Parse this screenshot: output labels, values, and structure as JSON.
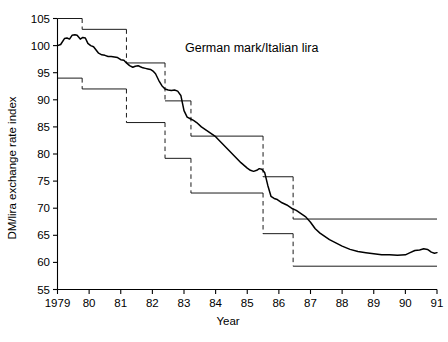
{
  "chart_data": {
    "type": "line",
    "title": "German mark/Italian lira",
    "xlabel": "Year",
    "ylabel": "DM/lira exchange rate index",
    "xlim": [
      1979,
      1991
    ],
    "ylim": [
      55,
      105
    ],
    "ytick_values": [
      55,
      60,
      65,
      70,
      75,
      80,
      85,
      90,
      95,
      100,
      105
    ],
    "ytick_labels": [
      "55",
      "60",
      "65",
      "70",
      "75",
      "80",
      "85",
      "90",
      "95",
      "100",
      "105"
    ],
    "xtick_values": [
      1979,
      1980,
      1981,
      1982,
      1983,
      1984,
      1985,
      1986,
      1987,
      1988,
      1989,
      1990,
      1991
    ],
    "xtick_labels": [
      "1979",
      "80",
      "81",
      "82",
      "83",
      "84",
      "85",
      "86",
      "87",
      "88",
      "89",
      "90",
      "91"
    ],
    "grid": false,
    "legend": false,
    "series": [
      {
        "name": "DM/lira exchange rate index",
        "style": "solid-thick",
        "x": [
          1979.0,
          1979.1,
          1979.22,
          1979.3,
          1979.38,
          1979.46,
          1979.55,
          1979.62,
          1979.72,
          1979.8,
          1979.88,
          1979.96,
          1980.05,
          1980.14,
          1980.22,
          1980.3,
          1980.4,
          1980.5,
          1980.6,
          1980.7,
          1980.8,
          1980.9,
          1981.0,
          1981.1,
          1981.18,
          1981.28,
          1981.38,
          1981.46,
          1981.55,
          1981.62,
          1981.7,
          1981.78,
          1981.86,
          1981.94,
          1982.02,
          1982.1,
          1982.2,
          1982.3,
          1982.4,
          1982.5,
          1982.6,
          1982.7,
          1982.8,
          1982.9,
          1983.0,
          1983.1,
          1983.2,
          1983.3,
          1983.4,
          1983.55,
          1983.7,
          1983.85,
          1984.0,
          1984.2,
          1984.4,
          1984.6,
          1984.8,
          1985.0,
          1985.1,
          1985.2,
          1985.3,
          1985.38,
          1985.46,
          1985.55,
          1985.65,
          1985.75,
          1985.85,
          1985.95,
          1986.1,
          1986.25,
          1986.4,
          1986.55,
          1986.7,
          1986.85,
          1987.0,
          1987.15,
          1987.3,
          1987.45,
          1987.6,
          1987.8,
          1988.0,
          1988.25,
          1988.5,
          1988.75,
          1989.0,
          1989.25,
          1989.5,
          1989.75,
          1990.0,
          1990.15,
          1990.3,
          1990.45,
          1990.58,
          1990.7,
          1990.82,
          1990.92,
          1991.0
        ],
        "y": [
          100.0,
          100.2,
          101.3,
          101.4,
          101.2,
          101.9,
          102.0,
          101.9,
          101.2,
          101.5,
          101.4,
          100.4,
          100.0,
          99.8,
          99.2,
          98.6,
          98.3,
          98.2,
          98.0,
          98.0,
          97.9,
          97.8,
          97.4,
          97.3,
          96.8,
          96.3,
          96.0,
          96.2,
          96.3,
          96.1,
          95.9,
          95.8,
          95.7,
          95.6,
          95.3,
          94.8,
          93.6,
          92.6,
          92.0,
          91.8,
          91.7,
          91.8,
          91.6,
          90.8,
          88.0,
          86.8,
          86.5,
          86.2,
          85.8,
          85.0,
          84.4,
          83.8,
          83.2,
          82.0,
          80.8,
          79.6,
          78.4,
          77.4,
          77.0,
          76.8,
          77.0,
          77.3,
          77.2,
          76.6,
          74.2,
          72.2,
          71.8,
          71.6,
          71.0,
          70.6,
          70.0,
          69.6,
          69.0,
          68.4,
          67.4,
          66.2,
          65.4,
          64.8,
          64.2,
          63.6,
          63.0,
          62.4,
          62.0,
          61.8,
          61.6,
          61.4,
          61.4,
          61.3,
          61.4,
          61.8,
          62.2,
          62.3,
          62.5,
          62.4,
          61.9,
          61.7,
          61.8
        ]
      }
    ],
    "bands": {
      "description": "Stepped intervention band limits with dashed vertical realignment connectors",
      "upper": {
        "name": "upper band limit",
        "steps": [
          {
            "x_start": 1979.0,
            "x_end": 1979.78,
            "y": 105.0
          },
          {
            "x_start": 1979.78,
            "x_end": 1981.18,
            "y": 103.0
          },
          {
            "x_start": 1981.18,
            "x_end": 1982.4,
            "y": 96.8
          },
          {
            "x_start": 1982.4,
            "x_end": 1983.22,
            "y": 89.8
          },
          {
            "x_start": 1983.22,
            "x_end": 1985.5,
            "y": 83.3
          },
          {
            "x_start": 1985.5,
            "x_end": 1986.45,
            "y": 75.8
          },
          {
            "x_start": 1986.45,
            "x_end": 1991.0,
            "y": 68.0
          }
        ],
        "connectors_x": [
          1981.18,
          1982.4,
          1983.22,
          1985.5,
          1986.45
        ]
      },
      "lower": {
        "name": "lower band limit",
        "steps": [
          {
            "x_start": 1979.0,
            "x_end": 1979.78,
            "y": 94.0
          },
          {
            "x_start": 1979.78,
            "x_end": 1981.18,
            "y": 92.0
          },
          {
            "x_start": 1981.18,
            "x_end": 1982.4,
            "y": 85.8
          },
          {
            "x_start": 1982.4,
            "x_end": 1983.22,
            "y": 79.2
          },
          {
            "x_start": 1983.22,
            "x_end": 1985.5,
            "y": 72.8
          },
          {
            "x_start": 1985.5,
            "x_end": 1986.45,
            "y": 65.3
          },
          {
            "x_start": 1986.45,
            "x_end": 1991.0,
            "y": 59.3
          }
        ],
        "connectors_x": [
          1981.18,
          1982.4,
          1983.22,
          1985.5,
          1986.45
        ]
      }
    }
  }
}
